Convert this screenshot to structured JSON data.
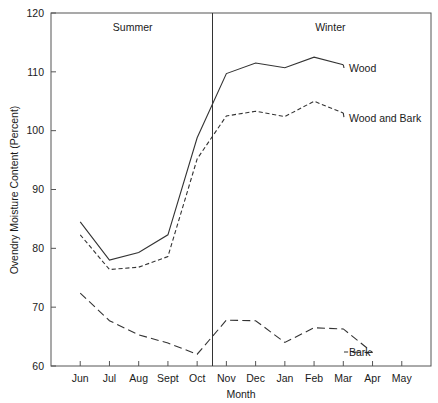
{
  "chart_data": {
    "type": "line",
    "title": "",
    "xlabel": "Month",
    "ylabel": "Ovendry Moisture Content (Percent)",
    "categories": [
      "Jun",
      "Jul",
      "Aug",
      "Sept",
      "Oct",
      "Nov",
      "Dec",
      "Jan",
      "Feb",
      "Mar",
      "Apr",
      "May"
    ],
    "xlim": [
      0,
      11
    ],
    "ylim": [
      60,
      120
    ],
    "yticks": [
      60,
      70,
      80,
      90,
      100,
      110,
      120
    ],
    "grid": false,
    "legend_position": "right-inline",
    "series": [
      {
        "name": "Wood",
        "style": "solid",
        "values": [
          84.5,
          78.0,
          79.3,
          82.3,
          98.8,
          109.7,
          111.5,
          110.7,
          112.5,
          111.2,
          null,
          null
        ],
        "label": "Wood"
      },
      {
        "name": "Wood and Bark",
        "style": "dashed",
        "values": [
          82.3,
          76.4,
          76.8,
          78.6,
          95.2,
          102.5,
          103.3,
          102.4,
          105.0,
          103.0,
          null,
          null
        ],
        "label": "Wood and Bark"
      },
      {
        "name": "Bark",
        "style": "long-dashed",
        "values": [
          72.4,
          67.7,
          65.3,
          63.9,
          62.0,
          67.8,
          67.7,
          64.0,
          66.5,
          66.3,
          62.3,
          null
        ],
        "label": "Bark"
      }
    ],
    "annotations": [
      {
        "name": "summer-label",
        "text": "Summer",
        "x_fraction": 0.215,
        "y_value": 117.0
      },
      {
        "name": "winter-label",
        "text": "Winter",
        "x_fraction": 0.735,
        "y_value": 117.0
      },
      {
        "name": "season-divider",
        "type": "vline",
        "x_fraction": 0.425
      }
    ]
  },
  "axes": {
    "y_title": "Ovendry Moisture Content (Percent)",
    "x_title": "Month",
    "y_tick_labels": [
      "120",
      "110",
      "100",
      "90",
      "80",
      "70",
      "60"
    ],
    "x_tick_labels": [
      "Jun",
      "Jul",
      "Aug",
      "Sept",
      "Oct",
      "Nov",
      "Dec",
      "Jan",
      "Feb",
      "Mar",
      "Apr",
      "May"
    ]
  },
  "labels": {
    "summer": "Summer",
    "winter": "Winter",
    "wood": "Wood",
    "wood_and_bark": "Wood and Bark",
    "bark": "Bark"
  },
  "colors": {
    "line": "#333333",
    "axis": "#555555",
    "text": "#1a1a1a",
    "background": "#ffffff"
  }
}
